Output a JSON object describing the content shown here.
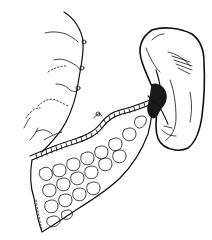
{
  "illustration": {
    "description": "Black-and-white anatomical line drawing: stomach edge (left), spleen (upper right), splenic vessels at hilum, and lobulated pancreas body/tail extending toward spleen",
    "colors": {
      "background": "#ffffff",
      "ink": "#111111"
    },
    "parts": [
      {
        "id": "stomach",
        "label": ""
      },
      {
        "id": "spleen",
        "label": ""
      },
      {
        "id": "splenic-hilum-vessels",
        "label": ""
      },
      {
        "id": "splenic-artery",
        "label": ""
      },
      {
        "id": "pancreas",
        "label": ""
      }
    ]
  }
}
